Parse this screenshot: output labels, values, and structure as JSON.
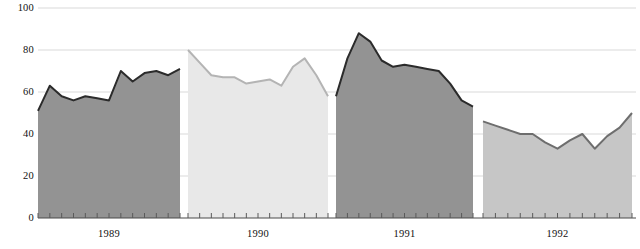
{
  "chart_data": {
    "type": "area",
    "title": "",
    "subtitle": "",
    "xlabel": "",
    "ylabel": "",
    "ylim": [
      0,
      100
    ],
    "ytick_values": [
      0,
      20,
      40,
      60,
      80,
      100
    ],
    "ytick_labels": [
      "0",
      "20",
      "40",
      "60",
      "80",
      "100"
    ],
    "grid": true,
    "grid_axis": "y",
    "legend": "none",
    "xtick_labels": [
      "1989",
      "1990",
      "1991",
      "1992"
    ],
    "x_minor_ticks_per_panel": 12,
    "x_minor_tick_meaning": "months",
    "panels": [
      {
        "name": "1989",
        "label": "1989",
        "color": "#939393",
        "line_color": "#2b2b2b",
        "x_start_px": 38,
        "x_end_px": 180,
        "values": [
          51,
          63,
          58,
          56,
          58,
          57,
          56,
          70,
          65,
          69,
          70,
          68,
          71
        ]
      },
      {
        "name": "1990",
        "label": "1990",
        "color": "#e8e8e8",
        "line_color": "#b4b4b4",
        "x_start_px": 188,
        "x_end_px": 328,
        "values": [
          80,
          74,
          68,
          67,
          67,
          64,
          65,
          66,
          63,
          72,
          76,
          68,
          58
        ]
      },
      {
        "name": "1991",
        "label": "1991",
        "color": "#939393",
        "line_color": "#2b2b2b",
        "x_start_px": 336,
        "x_end_px": 473,
        "values": [
          58,
          76,
          88,
          84,
          75,
          72,
          73,
          72,
          71,
          70,
          64,
          56,
          53
        ]
      },
      {
        "name": "1992",
        "label": "1992",
        "color": "#c6c6c6",
        "line_color": "#6e6e6e",
        "x_start_px": 483,
        "x_end_px": 632,
        "values": [
          46,
          44,
          42,
          40,
          40,
          36,
          33,
          37,
          40,
          33,
          39,
          43,
          50
        ]
      }
    ],
    "colors": {
      "panel_dark": "#939393",
      "panel_light": "#e8e8e8",
      "panel_mid": "#c6c6c6",
      "gridline": "#d9d9d9",
      "axis": "#4a4a4a",
      "text": "#111111"
    }
  }
}
